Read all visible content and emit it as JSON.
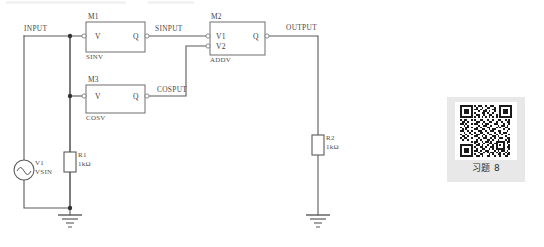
{
  "diagram": {
    "nets": [
      {
        "name": "INPUT",
        "x": 24,
        "y": 28
      },
      {
        "name": "SINPUT",
        "x": 155,
        "y": 28
      },
      {
        "name": "COSPUT",
        "x": 157,
        "y": 89
      },
      {
        "name": "OUTPUT",
        "x": 286,
        "y": 26
      }
    ],
    "blocks": [
      {
        "ref": "M1",
        "model": "SINV",
        "inputs": [
          "V"
        ],
        "outputs": [
          "Q"
        ],
        "x": 86,
        "y": 22,
        "w": 59,
        "h": 30
      },
      {
        "ref": "M3",
        "model": "COSV",
        "inputs": [
          "V"
        ],
        "outputs": [
          "Q"
        ],
        "x": 86,
        "y": 85,
        "w": 59,
        "h": 28
      },
      {
        "ref": "M2",
        "model": "ADDV",
        "inputs": [
          "V1",
          "V2"
        ],
        "outputs": [
          "Q"
        ],
        "x": 210,
        "y": 22,
        "w": 55,
        "h": 33
      }
    ],
    "components": [
      {
        "ref": "V1",
        "value": "VSIN",
        "type": "sine-source",
        "x": 22,
        "y": 160
      },
      {
        "ref": "R1",
        "value": "1kΩ",
        "type": "resistor",
        "x": 64,
        "y": 152
      },
      {
        "ref": "R2",
        "value": "1kΩ",
        "type": "resistor",
        "x": 316,
        "y": 135
      }
    ],
    "grounds": [
      {
        "x": 70,
        "y": 215
      },
      {
        "x": 318,
        "y": 215
      }
    ],
    "colors": {
      "wire": "#5a5a5a",
      "block_border": "#6e6e6e",
      "block_fill": "#ffffff",
      "text": "#444444",
      "panel_bg": "#e8e8e8",
      "qr_dark": "#1a1a1a",
      "page_bg": "#ffffff"
    }
  },
  "qr_panel": {
    "caption": "习题 8",
    "icon": "qr-code-icon"
  }
}
